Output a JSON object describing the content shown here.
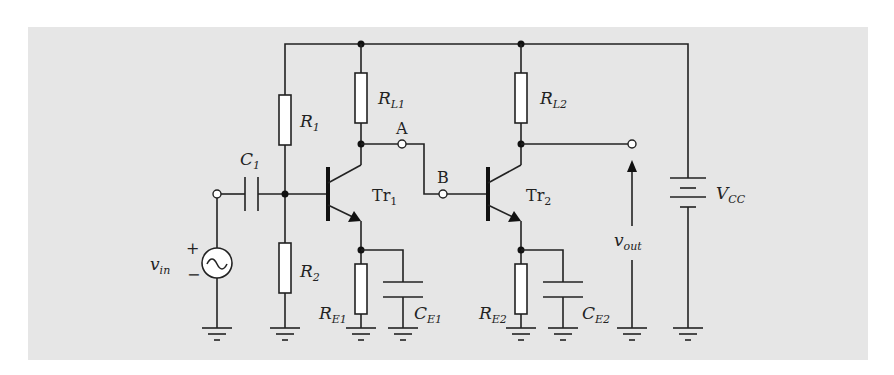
{
  "diagram": {
    "background_color": "#e6e6e6",
    "line_color": "#222222",
    "components": {
      "R1": {
        "label_main": "R",
        "label_sub": "1"
      },
      "R2": {
        "label_main": "R",
        "label_sub": "2"
      },
      "RL1": {
        "label_main": "R",
        "label_sub": "L1"
      },
      "RL2": {
        "label_main": "R",
        "label_sub": "L2"
      },
      "RE1": {
        "label_main": "R",
        "label_sub": "E1"
      },
      "RE2": {
        "label_main": "R",
        "label_sub": "E2"
      },
      "C1": {
        "label_main": "C",
        "label_sub": "1"
      },
      "CE1": {
        "label_main": "C",
        "label_sub": "E1"
      },
      "CE2": {
        "label_main": "C",
        "label_sub": "E2"
      },
      "Tr1": {
        "label_main": "Tr",
        "label_sub": "1"
      },
      "Tr2": {
        "label_main": "Tr",
        "label_sub": "2"
      },
      "VCC": {
        "label_main": "V",
        "label_sub": "CC"
      },
      "vin": {
        "label_main": "v",
        "label_sub": "in",
        "plus": "+",
        "minus": "−"
      },
      "vout": {
        "label_main": "v",
        "label_sub": "out"
      }
    },
    "nodes": {
      "A": "A",
      "B": "B"
    }
  }
}
